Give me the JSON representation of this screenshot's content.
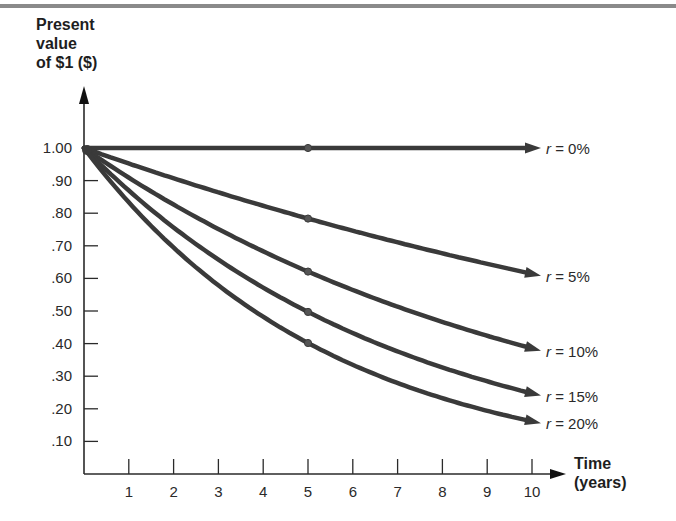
{
  "chart_data": {
    "type": "line",
    "title": "",
    "ylabel": "Present value of $1 ($)",
    "ylabel_lines": [
      "Present",
      "value",
      "of $1 ($)"
    ],
    "xlabel": "Time (years)",
    "xlabel_lines": [
      "Time",
      "(years)"
    ],
    "x": [
      0,
      1,
      2,
      3,
      4,
      5,
      6,
      7,
      8,
      9,
      10
    ],
    "x_tick_labels": [
      "1",
      "2",
      "3",
      "4",
      "5",
      "6",
      "7",
      "8",
      "9",
      "10"
    ],
    "y_tick_labels": [
      "1.00",
      ".90",
      ".80",
      ".70",
      ".60",
      ".50",
      ".40",
      ".30",
      ".20",
      ".10"
    ],
    "y_ticks": [
      1.0,
      0.9,
      0.8,
      0.7,
      0.6,
      0.5,
      0.4,
      0.3,
      0.2,
      0.1
    ],
    "xlim": [
      0,
      10
    ],
    "ylim": [
      0,
      1.0
    ],
    "grid": false,
    "legend_position": "inline-right",
    "series": [
      {
        "name": "r = 0%",
        "rate": 0.0,
        "values": [
          1.0,
          1.0,
          1.0,
          1.0,
          1.0,
          1.0,
          1.0,
          1.0,
          1.0,
          1.0,
          1.0
        ]
      },
      {
        "name": "r = 5%",
        "rate": 0.05,
        "values": [
          1.0,
          0.95,
          0.91,
          0.86,
          0.82,
          0.78,
          0.75,
          0.71,
          0.68,
          0.64,
          0.61
        ]
      },
      {
        "name": "r = 10%",
        "rate": 0.1,
        "values": [
          1.0,
          0.91,
          0.83,
          0.75,
          0.68,
          0.62,
          0.56,
          0.51,
          0.47,
          0.42,
          0.39
        ]
      },
      {
        "name": "r = 15%",
        "rate": 0.15,
        "values": [
          1.0,
          0.87,
          0.76,
          0.66,
          0.57,
          0.5,
          0.43,
          0.38,
          0.33,
          0.28,
          0.25
        ]
      },
      {
        "name": "r = 20%",
        "rate": 0.2,
        "values": [
          1.0,
          0.83,
          0.69,
          0.58,
          0.48,
          0.4,
          0.33,
          0.28,
          0.23,
          0.19,
          0.16
        ]
      }
    ],
    "markers": {
      "x": 5,
      "note": "dot marker on each curve at year 5"
    },
    "colors": {
      "line": "#3a3a3a",
      "axis": "#2a2a2a",
      "text": "#2a2a2a",
      "top_rule": "#8a8a8a"
    }
  }
}
